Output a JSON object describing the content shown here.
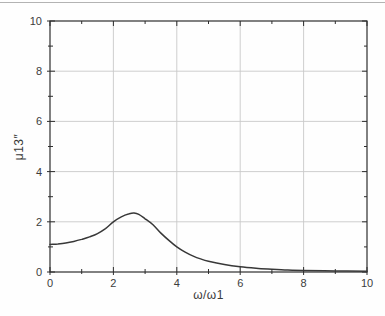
{
  "chart_data": {
    "type": "line",
    "title": "",
    "xlabel": "ω/ω1",
    "ylabel": "μ13″",
    "xlim": [
      0,
      10
    ],
    "ylim": [
      0,
      10
    ],
    "x_major_ticks": [
      0,
      2,
      4,
      6,
      8,
      10
    ],
    "y_major_ticks": [
      0,
      2,
      4,
      6,
      8,
      10
    ],
    "minor_tick_step": 1,
    "grid": true,
    "legend": "none",
    "series": [
      {
        "name": "mu13-imaginary-part",
        "x": [
          0,
          0.25,
          0.5,
          0.75,
          1,
          1.25,
          1.5,
          1.75,
          2,
          2.25,
          2.5,
          2.65,
          2.8,
          3,
          3.25,
          3.5,
          3.75,
          4,
          4.25,
          4.5,
          4.75,
          5,
          5.5,
          6,
          6.5,
          7,
          7.5,
          8,
          9,
          10
        ],
        "y": [
          1.1,
          1.12,
          1.16,
          1.22,
          1.3,
          1.4,
          1.53,
          1.73,
          2.0,
          2.2,
          2.32,
          2.35,
          2.3,
          2.12,
          1.88,
          1.55,
          1.26,
          1.0,
          0.8,
          0.64,
          0.52,
          0.43,
          0.3,
          0.21,
          0.15,
          0.11,
          0.08,
          0.06,
          0.04,
          0.03
        ]
      }
    ],
    "colors": {
      "curve": "#383838",
      "grid": "#c8c8c8",
      "axis": "#2e2e2e",
      "text": "#3c3c3c",
      "page_rule": "#b3b3b3",
      "background": "#fefefe"
    }
  }
}
